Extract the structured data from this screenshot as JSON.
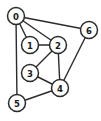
{
  "diagram": {
    "background_color": "#ffffff",
    "node_fill_color": "#ffffff",
    "node_stroke_color": "#2b2b2b",
    "edge_color": "#2b2b2b",
    "label_color": "#1a1a1a",
    "node_radius": 8.5,
    "width": 101,
    "height": 121
  },
  "chart_data": {
    "type": "diagram",
    "graph_type": "undirected",
    "node_count": 7,
    "edge_count": 10,
    "nodes": [
      {
        "id": "0",
        "label": "0",
        "x": 16,
        "y": 16
      },
      {
        "id": "1",
        "label": "1",
        "x": 30,
        "y": 45
      },
      {
        "id": "2",
        "label": "2",
        "x": 58,
        "y": 45
      },
      {
        "id": "3",
        "label": "3",
        "x": 30,
        "y": 73
      },
      {
        "id": "4",
        "label": "4",
        "x": 60,
        "y": 88
      },
      {
        "id": "5",
        "label": "5",
        "x": 17,
        "y": 103
      },
      {
        "id": "6",
        "label": "6",
        "x": 89,
        "y": 30
      }
    ],
    "edges": [
      {
        "source": "0",
        "target": "1"
      },
      {
        "source": "0",
        "target": "2"
      },
      {
        "source": "0",
        "target": "6"
      },
      {
        "source": "0",
        "target": "5"
      },
      {
        "source": "1",
        "target": "2"
      },
      {
        "source": "2",
        "target": "3"
      },
      {
        "source": "2",
        "target": "4"
      },
      {
        "source": "3",
        "target": "4"
      },
      {
        "source": "4",
        "target": "5"
      },
      {
        "source": "4",
        "target": "6"
      }
    ],
    "adjacency": {
      "0": [
        "1",
        "2",
        "5",
        "6"
      ],
      "1": [
        "0",
        "2"
      ],
      "2": [
        "0",
        "1",
        "3",
        "4"
      ],
      "3": [
        "2",
        "4"
      ],
      "4": [
        "2",
        "3",
        "5",
        "6"
      ],
      "5": [
        "0",
        "4"
      ],
      "6": [
        "0",
        "4"
      ]
    }
  }
}
